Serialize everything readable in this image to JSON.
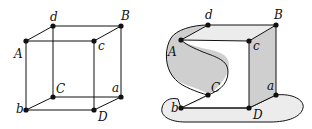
{
  "figures": {
    "cube": {
      "labels": {
        "A": "A",
        "B": "B",
        "C": "C",
        "D": "D",
        "a": "a",
        "b": "b",
        "c": "c",
        "d": "d"
      }
    },
    "deformed": {
      "labels": {
        "A": "A",
        "B": "B",
        "C": "C",
        "D": "D",
        "a": "a",
        "b": "b",
        "c": "c",
        "d": "d"
      }
    }
  },
  "colors": {
    "stroke": "#111111",
    "fill_light": "#ececec",
    "fill_dark": "#cfcfcf"
  }
}
